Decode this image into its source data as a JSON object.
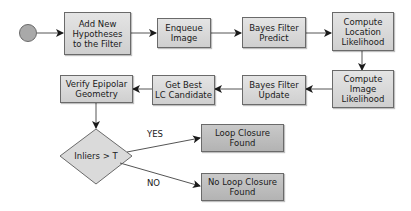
{
  "diagram": {
    "type": "flowchart",
    "start": {
      "shape": "circle",
      "fill": "#a9a9a9"
    },
    "nodes": [
      {
        "id": "add_hypotheses",
        "label": "Add New\nHypotheses\nto the Filter"
      },
      {
        "id": "enqueue_image",
        "label": "Enqueue\nImage"
      },
      {
        "id": "bayes_predict",
        "label": "Bayes Filter\nPredict"
      },
      {
        "id": "compute_location_likelihood",
        "label": "Compute\nLocation\nLikelihood"
      },
      {
        "id": "compute_image_likelihood",
        "label": "Compute\nImage\nLikelihood"
      },
      {
        "id": "bayes_update",
        "label": "Bayes Filter\nUpdate"
      },
      {
        "id": "get_best_lc",
        "label": "Get Best\nLC Candidate"
      },
      {
        "id": "verify_epipolar",
        "label": "Verify Epipolar\nGeometry"
      },
      {
        "id": "decision",
        "label": "Inliers > T",
        "shape": "diamond"
      },
      {
        "id": "loop_closure_found",
        "label": "Loop Closure\nFound"
      },
      {
        "id": "no_loop_closure_found",
        "label": "No Loop Closure\nFound"
      }
    ],
    "edges": [
      {
        "from": "start",
        "to": "add_hypotheses",
        "label": ""
      },
      {
        "from": "add_hypotheses",
        "to": "enqueue_image",
        "label": ""
      },
      {
        "from": "enqueue_image",
        "to": "bayes_predict",
        "label": ""
      },
      {
        "from": "bayes_predict",
        "to": "compute_location_likelihood",
        "label": ""
      },
      {
        "from": "compute_location_likelihood",
        "to": "compute_image_likelihood",
        "label": ""
      },
      {
        "from": "compute_image_likelihood",
        "to": "bayes_update",
        "label": ""
      },
      {
        "from": "bayes_update",
        "to": "get_best_lc",
        "label": ""
      },
      {
        "from": "get_best_lc",
        "to": "verify_epipolar",
        "label": ""
      },
      {
        "from": "verify_epipolar",
        "to": "decision",
        "label": ""
      },
      {
        "from": "decision",
        "to": "loop_closure_found",
        "label": "YES"
      },
      {
        "from": "decision",
        "to": "no_loop_closure_found",
        "label": "NO"
      }
    ],
    "colors": {
      "box_fill": "#d9d9d9",
      "terminal_fill": "#bdbdbd",
      "border": "#6a6a6a",
      "arrow": "#1a1a1a"
    }
  }
}
